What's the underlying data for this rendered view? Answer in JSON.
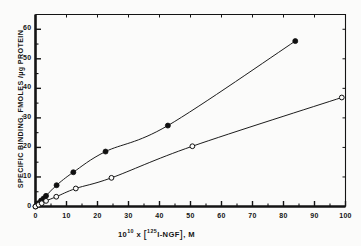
{
  "chart_data": {
    "type": "scatter",
    "title": "",
    "xlabel": "10^10 x [125I-NGF], M",
    "ylabel": "SPECIFIC BINDING, FMOLES /µg PROTEIN",
    "xlim": [
      0,
      100
    ],
    "ylim": [
      0,
      65
    ],
    "xticks": [
      0,
      10,
      20,
      30,
      40,
      50,
      60,
      70,
      80,
      90,
      100
    ],
    "xtick_labels": [
      "0",
      "10",
      "20",
      "30",
      "40",
      "50",
      "60",
      "70",
      "80",
      "90",
      "100"
    ],
    "yticks": [
      0,
      10,
      20,
      30,
      40,
      50,
      60
    ],
    "ytick_labels": [
      "0",
      "10",
      "20",
      "30",
      "40",
      "50",
      "60"
    ],
    "grid": false,
    "legend": "none",
    "marker_size": 4,
    "series": [
      {
        "name": "filled-circles",
        "marker": "filled-circle",
        "color": "#101010",
        "x": [
          0.0,
          0.9,
          1.8,
          2.6,
          3.4,
          6.8,
          12.2,
          22.6,
          42.7,
          83.8
        ],
        "y": [
          0.0,
          1.1,
          2.0,
          2.7,
          3.6,
          7.2,
          11.6,
          18.6,
          27.4,
          56.0
        ]
      },
      {
        "name": "open-circles",
        "marker": "open-circle",
        "color": "#101010",
        "x": [
          0.0,
          1.0,
          2.0,
          3.4,
          6.7,
          13.0,
          24.5,
          50.6,
          98.8
        ],
        "y": [
          0.0,
          0.6,
          1.1,
          1.9,
          3.3,
          6.1,
          9.7,
          20.4,
          36.9
        ]
      }
    ]
  },
  "axes": {
    "xlabel_parts": {
      "ten": "10",
      "exponent": "10",
      "times": "x",
      "bracket_open": "[",
      "isotope": "125",
      "ligand": "I-NGF",
      "bracket_close": "]",
      "unit": ", M"
    },
    "ylabel_text": "SPECIFIC BINDING, FMOLES /µg PROTEIN"
  }
}
